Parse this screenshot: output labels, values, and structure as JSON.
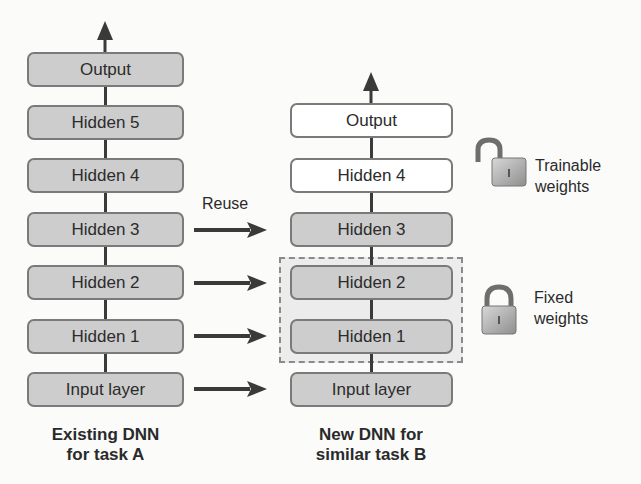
{
  "diagram": {
    "type": "transfer-learning-layer-reuse",
    "left_network": {
      "caption_line1": "Existing DNN",
      "caption_line2": "for task A",
      "layers": [
        {
          "label": "Output"
        },
        {
          "label": "Hidden 5"
        },
        {
          "label": "Hidden 4"
        },
        {
          "label": "Hidden 3"
        },
        {
          "label": "Hidden 2"
        },
        {
          "label": "Hidden 1"
        },
        {
          "label": "Input layer"
        }
      ]
    },
    "right_network": {
      "caption_line1": "New DNN for",
      "caption_line2": "similar task B",
      "layers": [
        {
          "label": "Output",
          "state": "trainable"
        },
        {
          "label": "Hidden 4",
          "state": "trainable"
        },
        {
          "label": "Hidden 3",
          "state": "reused"
        },
        {
          "label": "Hidden 2",
          "state": "fixed"
        },
        {
          "label": "Hidden 1",
          "state": "fixed"
        },
        {
          "label": "Input layer",
          "state": "reused"
        }
      ]
    },
    "reuse_label": "Reuse",
    "reuse_arrows": [
      "Hidden 3",
      "Hidden 2",
      "Hidden 1",
      "Input layer"
    ],
    "legend": {
      "trainable": {
        "icon": "unlocked-padlock-icon",
        "line1": "Trainable",
        "line2": "weights"
      },
      "fixed": {
        "icon": "locked-padlock-icon",
        "line1": "Fixed",
        "line2": "weights"
      }
    },
    "colors": {
      "layer_fill_gray": "#cdcdcd",
      "layer_fill_white": "#ffffff",
      "layer_border": "#7a7a7a",
      "arrow": "#3a3a3a",
      "frozen_frame_fill": "#ececec"
    }
  }
}
